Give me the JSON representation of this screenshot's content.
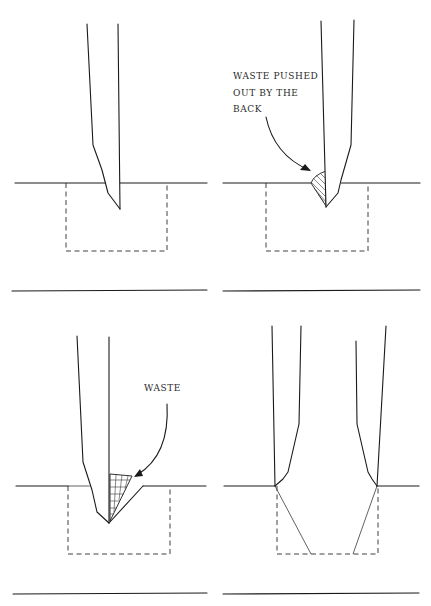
{
  "figure": {
    "type": "technical-illustration",
    "line_color": "#1a1a1a",
    "background": "#ffffff"
  },
  "panels": [
    {
      "id": "panel-1",
      "description": "Chisel entering wood, bevel facing the waste",
      "labels": []
    },
    {
      "id": "panel-2",
      "description": "Chisel driven in; waste pushed out by the back",
      "labels": [
        {
          "lines": [
            "WASTE PUSHED",
            "OUT BY THE",
            "BACK"
          ]
        }
      ]
    },
    {
      "id": "panel-3",
      "description": "Chisel reversed; waste removed in front of bevel",
      "labels": [
        {
          "lines": [
            "WASTE"
          ]
        }
      ]
    },
    {
      "id": "panel-4",
      "description": "Chisels at both ends of mortise showing bevel angles",
      "labels": []
    }
  ],
  "text": {
    "panel2_label": "WASTE PUSHED\nOUT BY THE\nBACK",
    "panel3_label": "WASTE"
  }
}
